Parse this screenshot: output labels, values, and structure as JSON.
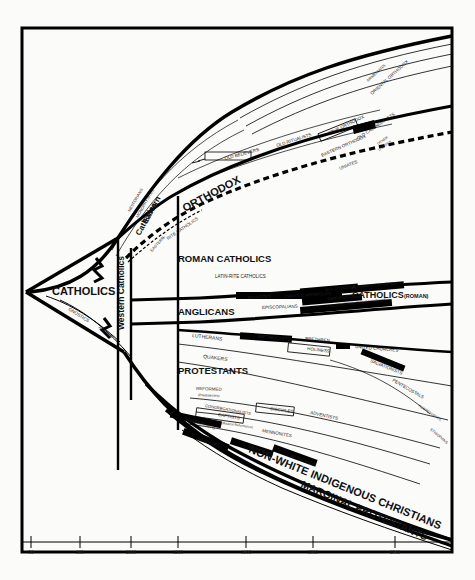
{
  "figure": {
    "kind": "genealogical-stream-diagram",
    "background": "#fbfbfa",
    "ink": "#000000"
  },
  "axis": {
    "orientation": "horizontal",
    "label": "",
    "ticks": [
      {
        "value": "30",
        "x": 31
      },
      {
        "value": "500",
        "x": 80
      },
      {
        "value": "1000",
        "x": 131
      },
      {
        "value": "1500",
        "x": 178
      },
      {
        "value": "1800",
        "x": 246
      },
      {
        "value": "1900",
        "x": 313
      },
      {
        "value": "1960",
        "x": 395
      }
    ]
  },
  "major_labels": [
    {
      "name": "catholics",
      "text": "CATHOLICS",
      "x": 52,
      "y": 295,
      "size": 11,
      "rot": 0
    },
    {
      "name": "orthodox",
      "text": "ORTHODOX",
      "x": 185,
      "y": 212,
      "size": 11,
      "rot": -28
    },
    {
      "name": "roman-catholics",
      "text": "ROMAN CATHOLICS",
      "x": 178,
      "y": 262,
      "size": 9.5,
      "rot": 0
    },
    {
      "name": "anglicans",
      "text": "ANGLICANS",
      "x": 178,
      "y": 315,
      "size": 9.5,
      "rot": 0
    },
    {
      "name": "protestants",
      "text": "PROTESTANTS",
      "x": 178,
      "y": 374,
      "size": 9.5,
      "rot": 0
    },
    {
      "name": "western-catholics",
      "text": "Western Catholics",
      "x": 124,
      "y": 330,
      "size": 8.5,
      "rot": -90
    },
    {
      "name": "eastern-catholics",
      "text": "Eastern",
      "x": 147,
      "y": 224,
      "size": 8,
      "rot": -62
    },
    {
      "name": "eastern-catholics-2",
      "text": "Catholics",
      "x": 140,
      "y": 236,
      "size": 8,
      "rot": -62
    },
    {
      "name": "catholics-roman",
      "text": "CATHOLICS",
      "x": 352,
      "y": 298,
      "size": 9,
      "rot": 0
    },
    {
      "name": "catholics-roman-paren",
      "text": "(ROMAN)",
      "x": 404,
      "y": 298,
      "size": 5.5,
      "rot": 0
    },
    {
      "name": "non-white",
      "text": "NON-WHITE INDIGENOUS CHRISTIANS",
      "x": 248,
      "y": 452,
      "size": 11,
      "rot": 22
    },
    {
      "name": "marginal-protestants",
      "text": "MARGINAL PROTESTANTS",
      "x": 300,
      "y": 487,
      "size": 10.5,
      "rot": 23
    }
  ],
  "small_labels": [
    {
      "name": "gnostics",
      "text": "GNOSTICS",
      "x": 68,
      "y": 310,
      "size": 4.5,
      "rot": 32
    },
    {
      "name": "arians",
      "text": "ARIANS",
      "x": 98,
      "y": 328,
      "size": 4.5,
      "rot": 40
    },
    {
      "name": "nestorians",
      "text": "NESTORIANS",
      "x": 130,
      "y": 212,
      "size": 4,
      "rot": -60
    },
    {
      "name": "monophysites",
      "text": "MONOPHYSITES",
      "x": 138,
      "y": 218,
      "size": 4,
      "rot": -60
    },
    {
      "name": "old-believers",
      "text": "OLD BELIEVERS",
      "x": 225,
      "y": 160,
      "size": 4.5,
      "rot": -15
    },
    {
      "name": "old-ritualists",
      "text": "OLD RITUALISTS",
      "x": 277,
      "y": 147,
      "size": 4.5,
      "rot": -18
    },
    {
      "name": "true-orthodox",
      "text": "TRUE ORTHODOX",
      "x": 329,
      "y": 135,
      "size": 4.5,
      "rot": -26
    },
    {
      "name": "old-calendarists",
      "text": "OLD CALENDARISTS",
      "x": 358,
      "y": 140,
      "size": 4.5,
      "rot": -34
    },
    {
      "name": "eastern-orthodox",
      "text": "EASTERN ORTHODOX",
      "x": 322,
      "y": 157,
      "size": 4.5,
      "rot": -24
    },
    {
      "name": "armenians",
      "text": "ARMENIANS",
      "x": 368,
      "y": 82,
      "size": 4,
      "rot": -42
    },
    {
      "name": "oriental-orthodox",
      "text": "ORIENTAL ORTHODOX",
      "x": 372,
      "y": 95,
      "size": 4.5,
      "rot": -42
    },
    {
      "name": "uniates",
      "text": "UNIATES",
      "x": 340,
      "y": 170,
      "size": 4.5,
      "rot": -22
    },
    {
      "name": "other-uniates",
      "text": "OTHER",
      "x": 378,
      "y": 145,
      "size": 3.6,
      "rot": -34
    },
    {
      "name": "new-uniates",
      "text": "UNIATES",
      "x": 379,
      "y": 151,
      "size": 3.6,
      "rot": -34
    },
    {
      "name": "eastern-rite",
      "text": "EASTERN-",
      "x": 152,
      "y": 252,
      "size": 4,
      "rot": -48
    },
    {
      "name": "rite-catholics",
      "text": "RITE CATHOLICS",
      "x": 168,
      "y": 240,
      "size": 4.5,
      "rot": -34
    },
    {
      "name": "latin-rite",
      "text": "LATIN-RITE CATHOLICS",
      "x": 215,
      "y": 278,
      "size": 4.5,
      "rot": 0
    },
    {
      "name": "irvingites",
      "text": "IRVINGITES",
      "x": 248,
      "y": 299,
      "size": 4,
      "rot": -4
    },
    {
      "name": "catholic-apostolics",
      "text": "CATHOLIC APOSTOLICS",
      "x": 285,
      "y": 298,
      "size": 4,
      "rot": -4
    },
    {
      "name": "old-catholics",
      "text": "OLD CATHOLICS",
      "x": 325,
      "y": 291,
      "size": 3.8,
      "rot": -6
    },
    {
      "name": "new-apostolics",
      "text": "NEW APOSTOLICS",
      "x": 328,
      "y": 300,
      "size": 3.8,
      "rot": -6
    },
    {
      "name": "reformed-catholics",
      "text": "REFORMED CATHOLICS",
      "x": 352,
      "y": 289,
      "size": 3.8,
      "rot": -6
    },
    {
      "name": "autocephalous",
      "text": "AUTOCEPHALOUS CATHOLICS",
      "x": 330,
      "y": 307,
      "size": 3.8,
      "rot": -6
    },
    {
      "name": "episcopalians",
      "text": "EPISCOPALIANS",
      "x": 262,
      "y": 309,
      "size": 4.5,
      "rot": -2
    },
    {
      "name": "lutherans",
      "text": "LUTHERANS",
      "x": 192,
      "y": 337,
      "size": 5,
      "rot": 7
    },
    {
      "name": "methodists",
      "text": "METHODISTS",
      "x": 258,
      "y": 338,
      "size": 5,
      "rot": 5
    },
    {
      "name": "brethren",
      "text": "BRETHREN",
      "x": 305,
      "y": 340,
      "size": 4.5,
      "rot": 5
    },
    {
      "name": "holiness",
      "text": "HOLINESS",
      "x": 307,
      "y": 350,
      "size": 4.5,
      "rot": 7
    },
    {
      "name": "united-churches",
      "text": "UNITED CHURCHES",
      "x": 355,
      "y": 348,
      "size": 4.5,
      "rot": 5
    },
    {
      "name": "quakers",
      "text": "QUAKERS",
      "x": 203,
      "y": 358,
      "size": 5,
      "rot": 7
    },
    {
      "name": "salvationists",
      "text": "SALVATIONISTS",
      "x": 370,
      "y": 362,
      "size": 4.5,
      "rot": 22
    },
    {
      "name": "pentecostals",
      "text": "PENTECOSTALS",
      "x": 392,
      "y": 381,
      "size": 4.5,
      "rot": 30
    },
    {
      "name": "reformed",
      "text": "REFORMED",
      "x": 196,
      "y": 390,
      "size": 4.5,
      "rot": 2
    },
    {
      "name": "presbyterians",
      "text": "(Presbyterians)",
      "x": 198,
      "y": 396,
      "size": 3.2,
      "rot": 2
    },
    {
      "name": "congregationalists",
      "text": "CONGREGATIONALISTS",
      "x": 205,
      "y": 407,
      "size": 4,
      "rot": 10
    },
    {
      "name": "baptists",
      "text": "BAPTISTS",
      "x": 218,
      "y": 416,
      "size": 4.5,
      "rot": 10
    },
    {
      "name": "disciples",
      "text": "DISCIPLES",
      "x": 270,
      "y": 410,
      "size": 4.5,
      "rot": 8
    },
    {
      "name": "adventists",
      "text": "ADVENTISTS",
      "x": 310,
      "y": 414,
      "size": 4.5,
      "rot": 12
    },
    {
      "name": "anabaptists",
      "text": "ANABAPTISTS",
      "x": 185,
      "y": 420,
      "size": 4.5,
      "rot": 18
    },
    {
      "name": "radical-reformation",
      "text": "(Radical Reformation)",
      "x": 222,
      "y": 424,
      "size": 3.2,
      "rot": 8
    },
    {
      "name": "mennonites",
      "text": "MENNONITES",
      "x": 262,
      "y": 432,
      "size": 4.5,
      "rot": 10
    },
    {
      "name": "hussites",
      "text": "HUSSITES",
      "x": 198,
      "y": 440,
      "size": 4.5,
      "rot": 20
    },
    {
      "name": "mormons",
      "text": "MORMONS",
      "x": 248,
      "y": 448,
      "size": 4.5,
      "rot": 18
    },
    {
      "name": "witnesses",
      "text": "WITNESSES",
      "x": 290,
      "y": 457,
      "size": 4.5,
      "rot": 20
    },
    {
      "name": "ethiopians",
      "text": "ETHIOPIANS",
      "x": 430,
      "y": 430,
      "size": 3.6,
      "rot": 40
    },
    {
      "name": "independents",
      "text": "INDEPENDENTS",
      "x": 418,
      "y": 406,
      "size": 3.4,
      "rot": 34
    }
  ]
}
